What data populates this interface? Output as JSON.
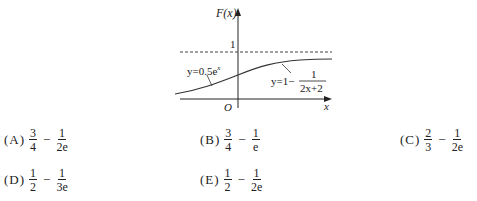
{
  "figure": {
    "y_axis_label": "F(x)",
    "x_axis_label": "x",
    "origin_label": "O",
    "asymptote_label": "1",
    "left_curve_label": "y=0.5e",
    "left_curve_exp": "x",
    "right_curve_label": "y=1−",
    "right_curve_frac_num": "1",
    "right_curve_frac_den": "2x+2"
  },
  "options": [
    {
      "label": "(A)",
      "a_num": "3",
      "a_den": "4",
      "b_num": "1",
      "b_den": "2e"
    },
    {
      "label": "(B)",
      "a_num": "3",
      "a_den": "4",
      "b_num": "1",
      "b_den": "e"
    },
    {
      "label": "(C)",
      "a_num": "2",
      "a_den": "3",
      "b_num": "1",
      "b_den": "2e"
    },
    {
      "label": "(D)",
      "a_num": "1",
      "a_den": "2",
      "b_num": "1",
      "b_den": "3e"
    },
    {
      "label": "(E)",
      "a_num": "1",
      "a_den": "2",
      "b_num": "1",
      "b_den": "2e"
    }
  ]
}
